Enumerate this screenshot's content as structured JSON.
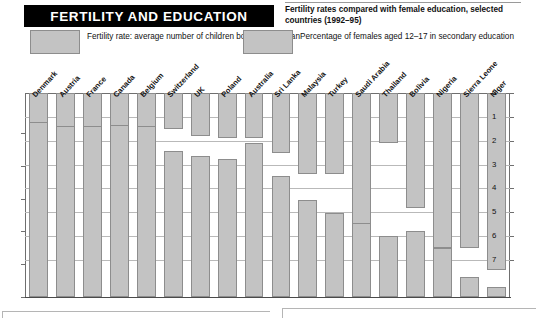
{
  "header": {
    "title": "FERTILITY AND EDUCATION",
    "subtitle": "Fertility rates compared with female education, selected countries (1992–95)"
  },
  "legend": [
    {
      "key": "fertility",
      "swatch_color": "#c3c3c3",
      "label": "Fertility rate: average number of children borne per woman"
    },
    {
      "key": "education",
      "swatch_color": "#c3c3c3",
      "label": "Percentage of females aged 12–17 in secondary education"
    }
  ],
  "chart_data": {
    "type": "bar",
    "title": "FERTILITY AND EDUCATION",
    "subtitle": "Fertility rates compared with female education, selected countries (1992–95)",
    "xlabel": "",
    "grid": true,
    "legend_position": "top",
    "categories": [
      "Denmark",
      "Austria",
      "France",
      "Canada",
      "Belgium",
      "Switzerland",
      "UK",
      "Poland",
      "Australia",
      "Sri Lanka",
      "Malaysia",
      "Turkey",
      "Saudi Arabia",
      "Thailand",
      "Bolivia",
      "Nigeria",
      "Sierra Leone",
      "Niger"
    ],
    "series": [
      {
        "name": "Fertility rate: average number of children borne per woman",
        "axis": "right",
        "ylabel": "Children per woman",
        "ylim": [
          0,
          7
        ],
        "yticks": [
          0,
          1,
          2,
          3,
          4,
          5,
          6,
          7
        ],
        "ytick_labels": [
          "0",
          "1",
          "2",
          "3",
          "4",
          "5",
          "6",
          "7"
        ],
        "inverted": true,
        "values": [
          1.5,
          1.5,
          1.5,
          1.6,
          1.6,
          1.5,
          1.8,
          1.9,
          1.9,
          2.5,
          3.4,
          3.4,
          6.4,
          2.1,
          4.8,
          6.5,
          6.5,
          7.4
        ]
      },
      {
        "name": "Percentage of females aged 12–17 in secondary education",
        "axis": "left",
        "ylabel": "Percentage in secondary education",
        "ylim": [
          0,
          100
        ],
        "yticks": [
          0,
          20,
          40,
          60,
          80,
          100
        ],
        "ytick_labels": [
          "0%",
          "20%",
          "40%",
          "60%",
          "80%",
          "100%"
        ],
        "values": [
          107,
          104,
          104,
          105,
          104,
          89,
          86,
          84,
          94,
          74,
          59,
          51,
          45,
          37,
          40,
          30,
          12,
          6
        ]
      }
    ]
  },
  "axes": {
    "left_ticks": [
      "100%",
      "80%",
      "60%",
      "40%",
      "20%",
      "0%"
    ],
    "right_ticks": [
      "0",
      "1",
      "2",
      "3",
      "4",
      "5",
      "6",
      "7"
    ]
  }
}
